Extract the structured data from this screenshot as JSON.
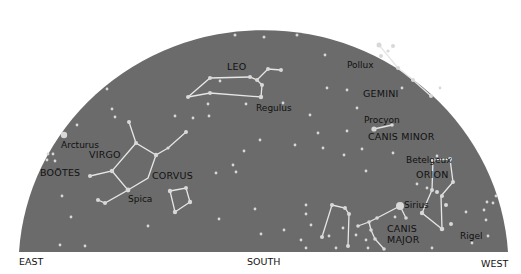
{
  "sky": {
    "fill": "#6b6b6b",
    "star_color": "#d8d8d8",
    "line_color": "#e6e6e6"
  },
  "directions": {
    "east": "EAST",
    "south": "SOUTH",
    "west": "WEST"
  },
  "constellations": {
    "leo": "LEO",
    "gemini": "GEMINI",
    "canis_minor": "CANIS MINOR",
    "orion": "ORION",
    "canis_major_1": "CANIS",
    "canis_major_2": "MAJOR",
    "corvus": "CORVUS",
    "virgo": "VIRGO",
    "bootes": "BOÖTES"
  },
  "stars": {
    "regulus": "Regulus",
    "pollux": "Pollux",
    "procyon": "Procyon",
    "betelgeuse": "Betelgeux",
    "sirius": "Sirius",
    "rigel": "Rigel",
    "spica": "Spica",
    "arcturus": "Arcturus"
  }
}
